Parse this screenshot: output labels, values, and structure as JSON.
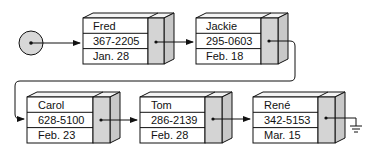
{
  "diagram": {
    "type": "singly-linked-list",
    "head": {
      "label": "head pointer"
    },
    "nodes": [
      {
        "name": "Fred",
        "phone": "367-2205",
        "date": "Jan. 28"
      },
      {
        "name": "Jackie",
        "phone": "295-0603",
        "date": "Feb. 18"
      },
      {
        "name": "Carol",
        "phone": "628-5100",
        "date": "Feb. 23"
      },
      {
        "name": "Tom",
        "phone": "286-2139",
        "date": "Feb. 28"
      },
      {
        "name": "René",
        "phone": "342-5153",
        "date": "Mar. 15"
      }
    ],
    "terminator": "ground (null)",
    "colors": {
      "pointer_fill": "#d4d4d4",
      "side_fill": "#c8c8c8",
      "line": "#111111"
    }
  }
}
